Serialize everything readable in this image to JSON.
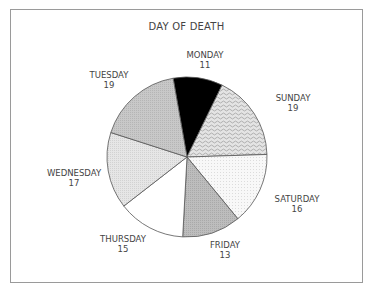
{
  "chart_data": {
    "type": "pie",
    "title": "DAY OF DEATH",
    "start_angle_deg": -10,
    "direction": "clockwise",
    "slices": [
      {
        "label": "MONDAY",
        "value": 11,
        "fill": "#000000",
        "pattern": "solid"
      },
      {
        "label": "SUNDAY",
        "value": 19,
        "fill": "#d6d6d6",
        "pattern": "wavy"
      },
      {
        "label": "SATURDAY",
        "value": 16,
        "fill": "#f6f6f6",
        "pattern": "fine-dot"
      },
      {
        "label": "FRIDAY",
        "value": 13,
        "fill": "#b4b4b4",
        "pattern": "stipple"
      },
      {
        "label": "THURSDAY",
        "value": 15,
        "fill": "#ffffff",
        "pattern": "none"
      },
      {
        "label": "WEDNESDAY",
        "value": 17,
        "fill": "#e2e2e2",
        "pattern": "stipple"
      },
      {
        "label": "TUESDAY",
        "value": 19,
        "fill": "#c2c2c2",
        "pattern": "stipple"
      }
    ],
    "total": 110,
    "legend": "none",
    "labels_outside": true
  },
  "labels": {
    "monday": {
      "name": "MONDAY",
      "value": "11"
    },
    "sunday": {
      "name": "SUNDAY",
      "value": "19"
    },
    "saturday": {
      "name": "SATURDAY",
      "value": "16"
    },
    "friday": {
      "name": "FRIDAY",
      "value": "13"
    },
    "thursday": {
      "name": "THURSDAY",
      "value": "15"
    },
    "wednesday": {
      "name": "WEDNESDAY",
      "value": "17"
    },
    "tuesday": {
      "name": "TUESDAY",
      "value": "19"
    }
  },
  "colors": {
    "frame": "#9a9a9a",
    "outline": "#555555",
    "text": "#444444"
  }
}
